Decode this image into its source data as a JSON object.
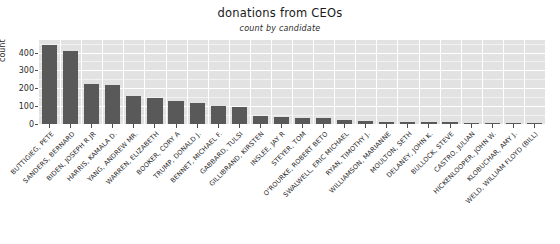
{
  "chart_data": {
    "type": "bar",
    "title": "donations from CEOs",
    "subtitle": "count by candidate",
    "xlabel": "",
    "ylabel": "count",
    "ylim": [
      0,
      470
    ],
    "grid": true,
    "legend": "none",
    "bar_color": "#595959",
    "panel_color": "#e2e2e2",
    "gridline_color": "#ffffff",
    "y_ticks": [
      "0",
      "100",
      "200",
      "300",
      "400"
    ],
    "y_tick_values": [
      0,
      100,
      200,
      300,
      400
    ],
    "categories": [
      "BUTTIGIEG, PETE",
      "SANDERS, BERNARD",
      "BIDEN, JOSEPH R JR",
      "HARRIS, KAMALA D.",
      "YANG, ANDREW MR.",
      "WARREN, ELIZABETH",
      "BOOKER, CORY A",
      "TRUMP, DONALD J.",
      "BENNET, MICHAEL F.",
      "GABBARD, TULSI",
      "GILLIBRAND, KIRSTEN",
      "INSLEE, JAY R",
      "STEYER, TOM",
      "O'ROURKE, ROBERT BETO",
      "SWALWELL, ERIC MICHAEL",
      "RYAN, TIMOTHY J.",
      "WILLIAMSON, MARIANNE",
      "MOULTON, SETH",
      "DELANEY, JOHN K.",
      "BULLOCK, STEVE",
      "CASTRO, JULIAN",
      "HICKENLOOPER, JOHN W.",
      "KLOBUCHAR, AMY J.",
      "WELD, WILLIAM FLOYD (BILL)"
    ],
    "values": [
      440,
      406,
      223,
      217,
      159,
      145,
      127,
      119,
      103,
      96,
      46,
      38,
      36,
      34,
      22,
      16,
      14,
      12,
      10,
      9,
      8,
      7,
      6,
      5
    ]
  }
}
